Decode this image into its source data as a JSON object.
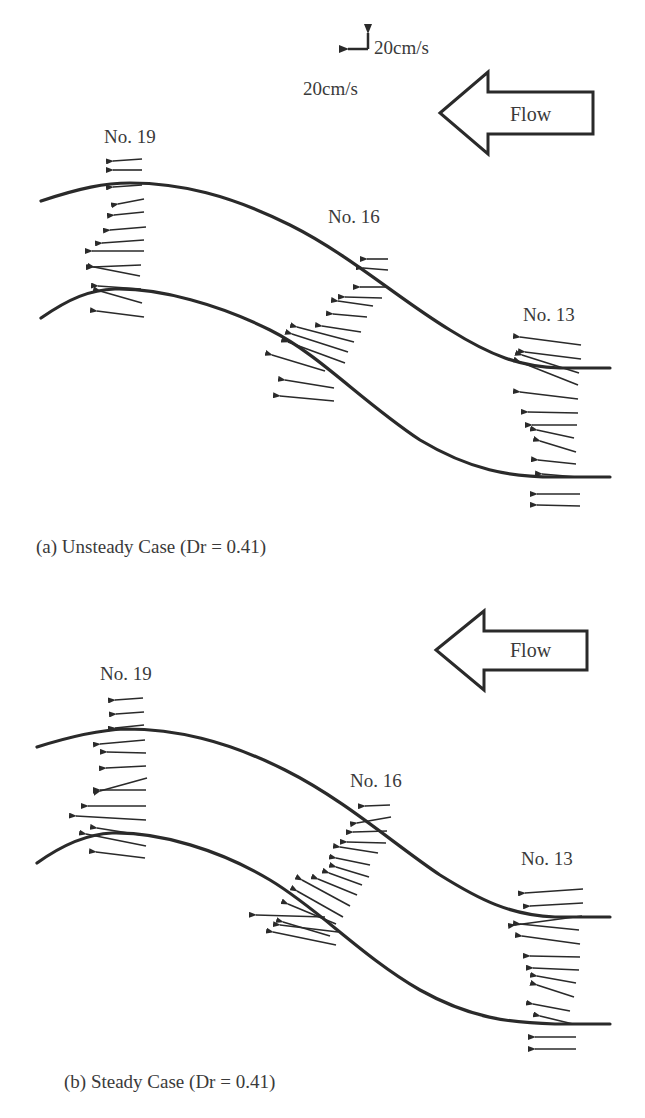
{
  "scale": {
    "vector_label_1": "20cm/s",
    "vector_label_2": "20cm/s"
  },
  "panels": [
    {
      "id": "a",
      "caption": "(a) Unsteady Case (Dr = 0.41)",
      "flow_label": "Flow",
      "sections": [
        {
          "label": "No. 19"
        },
        {
          "label": "No. 16"
        },
        {
          "label": "No. 13"
        }
      ]
    },
    {
      "id": "b",
      "caption": "(b) Steady Case (Dr = 0.41)",
      "flow_label": "Flow",
      "sections": [
        {
          "label": "No. 19"
        },
        {
          "label": "No. 16"
        },
        {
          "label": "No. 13"
        }
      ]
    }
  ],
  "colors": {
    "ink": "#2a2a2a",
    "text": "#3a3a3a",
    "background": "#ffffff"
  }
}
